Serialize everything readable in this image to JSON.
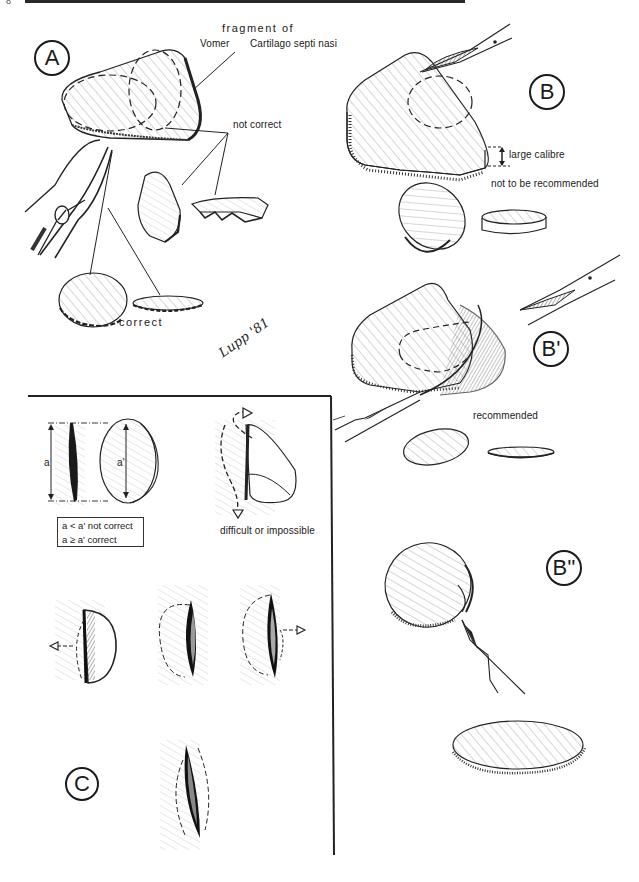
{
  "page": {
    "number": "8",
    "header_right": "",
    "signature": "Lupp '81"
  },
  "panels": {
    "A": {
      "label": "A",
      "annotations": {
        "fragment_of": "fragment of",
        "vomer": "Vomer",
        "cartilage": "Cartilago septi nasi",
        "not_correct": "not correct",
        "correct": "correct"
      }
    },
    "B": {
      "label": "B",
      "annotations": {
        "large_calibre": "large calibre",
        "not_recommended": "not to be recommended"
      }
    },
    "B1": {
      "label": "B'",
      "annotations": {
        "recommended": "recommended"
      }
    },
    "B2": {
      "label": "B''"
    },
    "C": {
      "label": "C",
      "annotations": {
        "a": "a",
        "a_prime": "a'",
        "legend_line1": "a < a' not correct",
        "legend_line2": "a ≥ a' correct",
        "difficult": "difficult or impossible"
      }
    }
  }
}
